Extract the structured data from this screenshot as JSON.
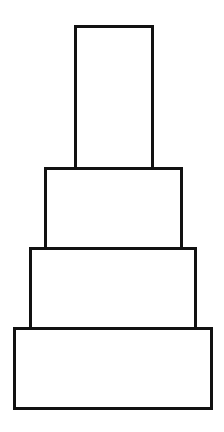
{
  "diagram": {
    "stroke_color": "#111111",
    "fill_color": "#ffffff",
    "background": "#ffffff",
    "tiers": [
      {
        "name": "top",
        "x": 74,
        "y": 25,
        "w": 80,
        "h": 145
      },
      {
        "name": "second",
        "x": 44,
        "y": 167,
        "w": 139,
        "h": 83
      },
      {
        "name": "third",
        "x": 29,
        "y": 247,
        "w": 168,
        "h": 83
      },
      {
        "name": "bottom",
        "x": 13,
        "y": 327,
        "w": 200,
        "h": 83
      }
    ]
  }
}
